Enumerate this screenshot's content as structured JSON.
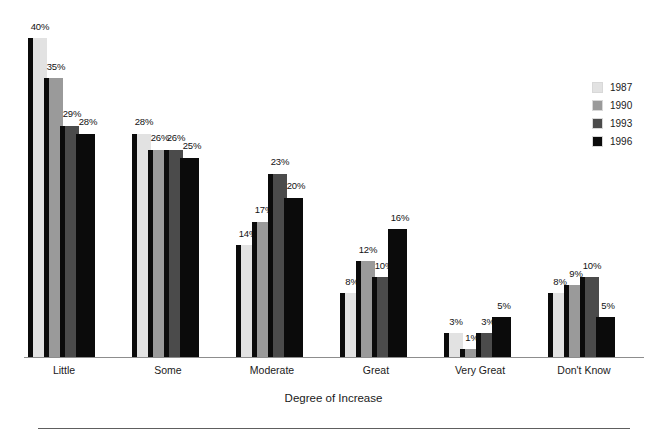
{
  "chart_data": {
    "type": "bar",
    "title": "",
    "subtitle": "",
    "xlabel": "Degree of Increase",
    "ylabel": "",
    "ylim": [
      0,
      42
    ],
    "grid": false,
    "legend_position": "right",
    "value_suffix": "%",
    "categories": [
      "Little",
      "Some",
      "Moderate",
      "Great",
      "Very Great",
      "Don't Know"
    ],
    "series": [
      {
        "name": "1987",
        "color": "#e2e2e2",
        "values": [
          40,
          28,
          14,
          8,
          3,
          8
        ]
      },
      {
        "name": "1990",
        "color": "#9a9a9a",
        "values": [
          35,
          26,
          17,
          12,
          1,
          9
        ]
      },
      {
        "name": "1993",
        "color": "#4b4b4b",
        "values": [
          29,
          26,
          23,
          10,
          3,
          10
        ]
      },
      {
        "name": "1996",
        "color": "#0b0b0b",
        "values": [
          28,
          25,
          20,
          16,
          5,
          5
        ]
      }
    ],
    "data_labels": [
      [
        "40%",
        "35%",
        "29%",
        "28%"
      ],
      [
        "28%",
        "26%",
        "26%",
        "25%"
      ],
      [
        "14%",
        "17%",
        "23%",
        "20%"
      ],
      [
        "8%",
        "12%",
        "10%",
        "16%"
      ],
      [
        "3%",
        "1%",
        "3%",
        "5%"
      ],
      [
        "8%",
        "9%",
        "10%",
        "5%"
      ]
    ]
  },
  "legend": {
    "items": [
      {
        "label": "1987",
        "color": "#e2e2e2"
      },
      {
        "label": "1990",
        "color": "#9a9a9a"
      },
      {
        "label": "1993",
        "color": "#4b4b4b"
      },
      {
        "label": "1996",
        "color": "#0b0b0b"
      }
    ]
  },
  "axis": {
    "title": "Degree of Increase"
  }
}
